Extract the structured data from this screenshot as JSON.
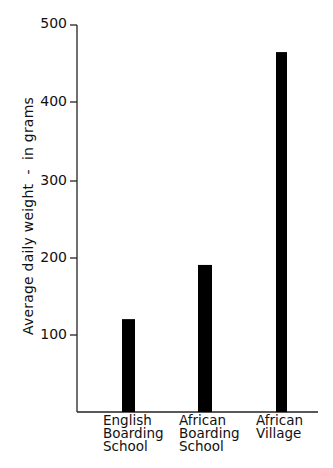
{
  "chart_data": {
    "type": "bar",
    "title": "",
    "xlabel": "",
    "ylabel": "Average daily weight  -  in grams",
    "categories": [
      "English Boarding School",
      "African Boarding School",
      "African Village"
    ],
    "category_lines": [
      [
        "English",
        "Boarding",
        "School"
      ],
      [
        "African",
        "Boarding",
        "School"
      ],
      [
        "African",
        "Village"
      ]
    ],
    "values": [
      120,
      190,
      465
    ],
    "ylim": [
      0,
      500
    ],
    "yticks": [
      100,
      200,
      300,
      400,
      500
    ],
    "ytick_labels": [
      "100",
      "200",
      "300",
      "400",
      "500"
    ],
    "grid": false,
    "legend": null,
    "bar_color": "#000000"
  },
  "axis": {
    "y_label": "Average daily weight  -  in grams"
  },
  "labels": {
    "cat0": "English\nBoarding\nSchool",
    "cat1": "African\nBoarding\nSchool",
    "cat2": "African\nVillage",
    "tick100": "100",
    "tick200": "200",
    "tick300": "300",
    "tick400": "400",
    "tick500": "500"
  }
}
